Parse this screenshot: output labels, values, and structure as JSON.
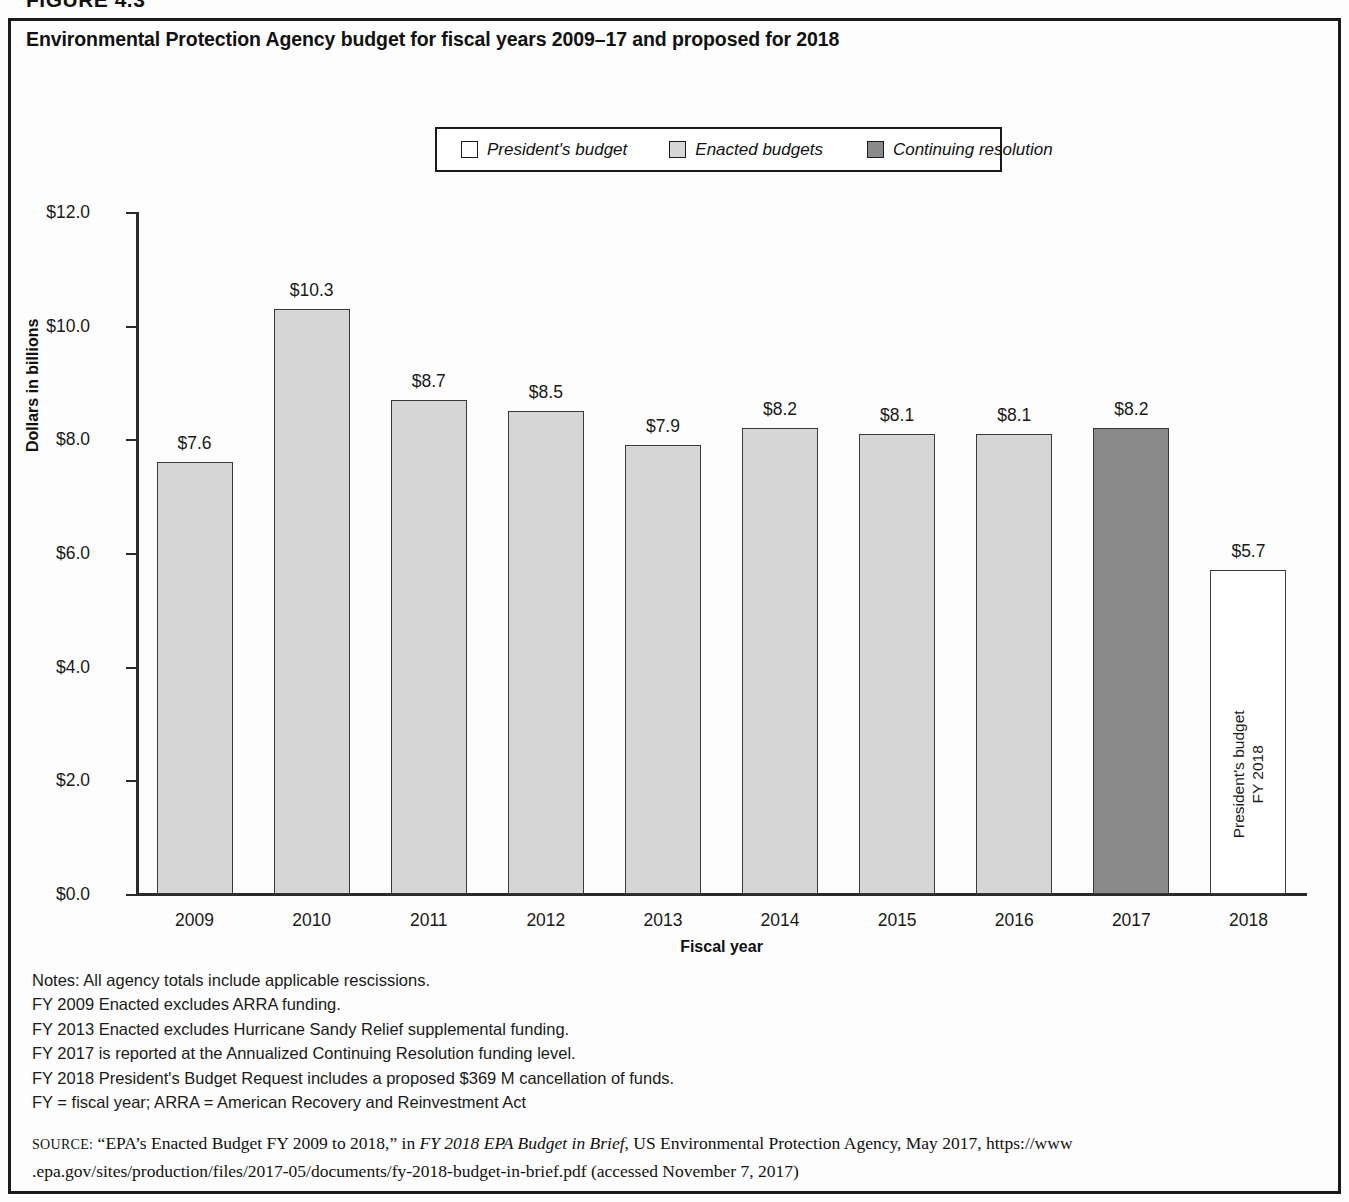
{
  "figure_number": "FIGURE 4.3",
  "chart_title": "Environmental Protection Agency budget for fiscal years 2009–17 and proposed for 2018",
  "legend": {
    "items": [
      {
        "label": "President's budget",
        "color": "#ffffff",
        "name": "presidents-budget"
      },
      {
        "label": "Enacted budgets",
        "color": "#d6d6d6",
        "name": "enacted-budgets"
      },
      {
        "label": "Continuing resolution",
        "color": "#8a8a8a",
        "name": "continuing-resolution"
      }
    ]
  },
  "axes": {
    "ylabel": "Dollars in billions",
    "xlabel": "Fiscal year",
    "yticks": [
      "$0.0",
      "$2.0",
      "$4.0",
      "$6.0",
      "$8.0",
      "$10.0",
      "$12.0"
    ]
  },
  "bar_inner_text": {
    "line1": "FY 2018",
    "line2": "President's budget"
  },
  "notes": [
    "Notes: All agency totals include applicable rescissions.",
    "FY 2009 Enacted excludes ARRA funding.",
    "FY 2013 Enacted excludes Hurricane Sandy Relief supplemental funding.",
    "FY 2017 is reported at the Annualized Continuing Resolution funding level.",
    "FY 2018 President's Budget Request includes a proposed $369 M cancellation of funds.",
    "FY = fiscal year; ARRA = American Recovery and Reinvestment Act"
  ],
  "source": {
    "prefix": "SOURCE:",
    "part1": " “EPA’s Enacted Budget FY 2009 to 2018,” in ",
    "italic": "FY 2018 EPA Budget in Brief",
    "part2": ", US Environmental Protection Agency, May 2017, https://www",
    "line2": ".epa.gov/sites/production/files/2017-05/documents/fy-2018-budget-in-brief.pdf (accessed November 7, 2017)"
  },
  "chart_data": {
    "type": "bar",
    "title": "Environmental Protection Agency budget for fiscal years 2009–17 and proposed for 2018",
    "xlabel": "Fiscal year",
    "ylabel": "Dollars in billions",
    "ylim": [
      0,
      12
    ],
    "ytick_step": 2,
    "grid": false,
    "legend_position": "top-center",
    "categories": [
      "2009",
      "2010",
      "2011",
      "2012",
      "2013",
      "2014",
      "2015",
      "2016",
      "2017",
      "2018"
    ],
    "values": [
      7.6,
      10.3,
      8.7,
      8.5,
      7.9,
      8.2,
      8.1,
      8.1,
      8.2,
      5.7
    ],
    "data_labels": [
      "$7.6",
      "$10.3",
      "$8.7",
      "$8.5",
      "$7.9",
      "$8.2",
      "$8.1",
      "$8.1",
      "$8.2",
      "$5.7"
    ],
    "series_of_bar": [
      "Enacted budgets",
      "Enacted budgets",
      "Enacted budgets",
      "Enacted budgets",
      "Enacted budgets",
      "Enacted budgets",
      "Enacted budgets",
      "Enacted budgets",
      "Continuing resolution",
      "President's budget"
    ],
    "bar_colors": [
      "#d6d6d6",
      "#d6d6d6",
      "#d6d6d6",
      "#d6d6d6",
      "#d6d6d6",
      "#d6d6d6",
      "#d6d6d6",
      "#d6d6d6",
      "#8a8a8a",
      "#ffffff"
    ],
    "annotations": [
      "FY 2018 President's budget"
    ]
  }
}
